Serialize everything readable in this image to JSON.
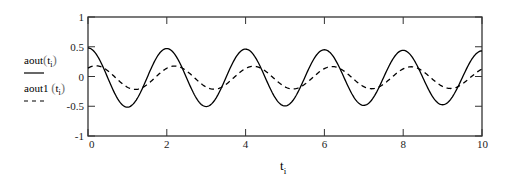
{
  "chart_data": {
    "type": "line",
    "title": "",
    "xlabel": "t_i",
    "ylabel": "",
    "xlim": [
      0,
      10
    ],
    "ylim": [
      -1,
      1
    ],
    "x_ticks": [
      "0",
      "2",
      "4",
      "6",
      "8",
      "10"
    ],
    "y_ticks": [
      "1",
      "0.5",
      "0",
      "-0.5",
      "-1"
    ],
    "grid": false,
    "legend_position": "left",
    "series": [
      {
        "name": "aout(t_i)",
        "style": "solid",
        "description": "sinusoid, period 2, amplitude ~0.5, peaks at t=0,2,4,6,8,10",
        "amplitude": 0.5,
        "period": 2,
        "phase": 0,
        "offset": -0.02,
        "x": [
          0,
          0.5,
          1,
          1.5,
          2,
          2.5,
          3,
          3.5,
          4,
          4.5,
          5,
          5.5,
          6,
          6.5,
          7,
          7.5,
          8,
          8.5,
          9,
          9.5,
          10
        ],
        "values": [
          0.5,
          -0.02,
          -0.52,
          -0.02,
          0.48,
          -0.02,
          -0.52,
          -0.02,
          0.46,
          -0.02,
          -0.52,
          -0.02,
          0.45,
          -0.02,
          -0.52,
          -0.02,
          0.45,
          -0.02,
          -0.52,
          -0.02,
          0.45
        ]
      },
      {
        "name": "aout1(t_i)",
        "style": "dashed",
        "description": "sinusoid, period 2, amplitude ~0.2, lagging phase",
        "amplitude": 0.2,
        "period": 2,
        "phase_lag": 0.2,
        "offset": -0.02,
        "x": [
          0,
          0.5,
          1,
          1.5,
          2,
          2.5,
          3,
          3.5,
          4,
          4.5,
          5,
          5.5,
          6,
          6.5,
          7,
          7.5,
          8,
          8.5,
          9,
          9.5,
          10
        ],
        "values": [
          0.17,
          0.1,
          -0.18,
          -0.14,
          0.17,
          0.1,
          -0.2,
          -0.14,
          0.16,
          0.1,
          -0.2,
          -0.14,
          0.15,
          0.1,
          -0.2,
          -0.14,
          0.15,
          0.1,
          -0.2,
          -0.14,
          0.15
        ]
      }
    ]
  },
  "legend": {
    "series1": {
      "name": "aout",
      "arg": "t",
      "sub": "i"
    },
    "series2": {
      "name": "aout1",
      "arg": "t",
      "sub": "i"
    }
  },
  "axis": {
    "x_label_main": "t",
    "x_label_sub": "i"
  }
}
